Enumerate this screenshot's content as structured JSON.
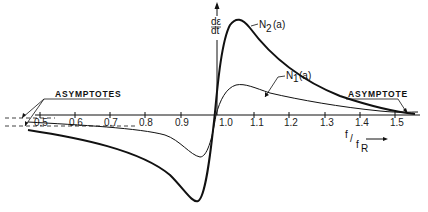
{
  "diagram": {
    "x_axis": {
      "label_num": "f",
      "label_den": "f",
      "label_den_sub": "R",
      "ticks": [
        "0.5",
        "0.6",
        "0.7",
        "0.8",
        "0.9",
        "1.0",
        "1.1",
        "1.2",
        "1.3",
        "1.4",
        "1.5"
      ]
    },
    "y_axis": {
      "label_top": "dε",
      "label_bottom": "dt"
    },
    "curves": [
      {
        "name": "N2",
        "label_main": "N",
        "label_sub": "2",
        "label_arg": "(a)"
      },
      {
        "name": "N1",
        "label_main": "N",
        "label_sub": "1",
        "label_arg": "(a)"
      }
    ],
    "annotations": {
      "left": "ASYMPTOTES",
      "right": "ASYMPTOTE"
    }
  },
  "colors": {
    "line": "#111111",
    "background": "#ffffff"
  }
}
